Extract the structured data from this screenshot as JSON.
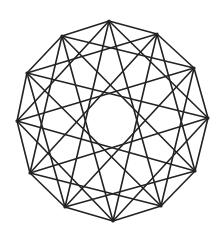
{
  "diagram": {
    "type": "star-polygon-chord-diagram",
    "vertex_count": 12,
    "chord_steps": [
      1,
      3,
      5
    ],
    "center": [
      112,
      121
    ],
    "radius": 100,
    "rotation_deg": -90,
    "vertices": [
      [
        109,
        21
      ],
      [
        157,
        34
      ],
      [
        194,
        68
      ],
      [
        208,
        118
      ],
      [
        195,
        171
      ],
      [
        161,
        206
      ],
      [
        113,
        221
      ],
      [
        65,
        207
      ],
      [
        30,
        173
      ],
      [
        17,
        121
      ],
      [
        27,
        73
      ],
      [
        62,
        36
      ]
    ],
    "colors": {
      "stroke": "#222222",
      "background": "#ffffff"
    },
    "stroke_width": 1.6
  }
}
